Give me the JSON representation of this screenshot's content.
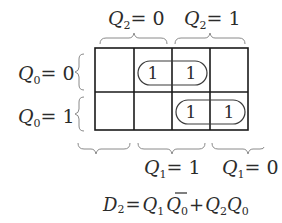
{
  "column_groups": [
    {
      "var": "Q",
      "sub": "2",
      "eq": "= 0"
    },
    {
      "var": "Q",
      "sub": "2",
      "eq": "= 1"
    }
  ],
  "row_labels": [
    {
      "var": "Q",
      "sub": "0",
      "eq": "= 0"
    },
    {
      "var": "Q",
      "sub": "0",
      "eq": "= 1"
    }
  ],
  "bottom_groups": [
    {
      "var": "",
      "sub": "",
      "eq": ""
    },
    {
      "var": "Q",
      "sub": "1",
      "eq": "= 1"
    },
    {
      "var": "Q",
      "sub": "1",
      "eq": "= 0"
    }
  ],
  "cells": [
    [
      "",
      "1",
      "1",
      ""
    ],
    [
      "",
      "",
      "1",
      "1"
    ]
  ],
  "groupings": [
    {
      "row": 0,
      "cols": [
        1,
        2
      ]
    },
    {
      "row": 1,
      "cols": [
        2,
        3
      ]
    }
  ],
  "equation": {
    "lhs_var": "D",
    "lhs_sub": "2",
    "equals": "=",
    "t1_a": "Q",
    "t1_a_sub": "1",
    "t1_b": "Q",
    "t1_b_sub": "0",
    "plus": "+",
    "t2_a": "Q",
    "t2_a_sub": "2",
    "t2_b": "Q",
    "t2_b_sub": "0"
  }
}
